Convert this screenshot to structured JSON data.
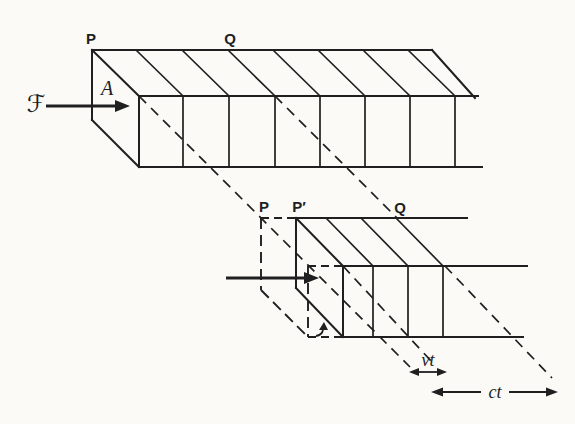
{
  "figure": {
    "upper_diagram": {
      "point_p": "P",
      "point_q": "Q",
      "force_symbol": "ℱ",
      "area_symbol": "A"
    },
    "lower_diagram": {
      "point_p": "P",
      "point_p_prime": "P′",
      "point_q": "Q",
      "piston_displacement": "vt",
      "wave_distance": "ct"
    }
  },
  "colors": {
    "ink": "#1f1f1f",
    "paper": "#fbfaf7"
  }
}
